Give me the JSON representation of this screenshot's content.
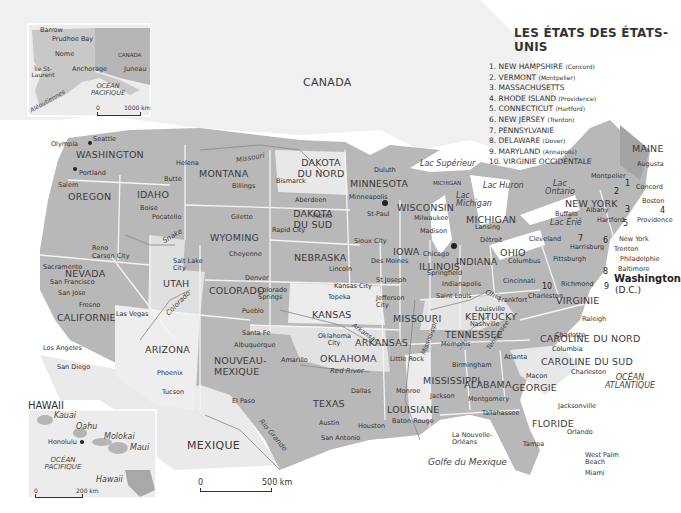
{
  "legend": {
    "title": "LES ÉTATS DES ÉTATS-UNIS",
    "items": [
      {
        "n": "1.",
        "state": "NEW HAMPSHIRE",
        "capital": "(Concord)"
      },
      {
        "n": "2.",
        "state": "VERMONT",
        "capital": "(Montpelier)"
      },
      {
        "n": "3.",
        "state": "MASSACHUSETTS",
        "capital": ""
      },
      {
        "n": "4.",
        "state": "RHODE ISLAND",
        "capital": "(Providence)"
      },
      {
        "n": "5.",
        "state": "CONNECTICUT",
        "capital": "(Hartford)"
      },
      {
        "n": "6.",
        "state": "NEW JERSEY",
        "capital": "(Trenton)"
      },
      {
        "n": "7.",
        "state": "PENNSYLVANIE",
        "capital": ""
      },
      {
        "n": "8.",
        "state": "DELAWARE",
        "capital": "(Dover)"
      },
      {
        "n": "9.",
        "state": "MARYLAND",
        "capital": "(Annapolis)"
      },
      {
        "n": "10.",
        "state": "VIRGINIE OCCIDENTALE",
        "capital": ""
      }
    ]
  },
  "countries": {
    "canada": "CANADA",
    "mexique": "MEXIQUE"
  },
  "oceans": {
    "atlantique": "OCÉAN ATLANTIQUE",
    "golfe": "Golfe du Mexique"
  },
  "alaska_inset": {
    "places": {
      "barrow": "Barrow",
      "prudhoe": "Prudhoe Bay",
      "nome": "Nome",
      "ile": "Île St-Laurent",
      "anchorage": "Anchorage",
      "juneau": "Juneau",
      "canada": "CANADA",
      "ocean": "OCÉAN PACIFIQUE",
      "aleoutiennes": "Aléoutiennes"
    },
    "scale": {
      "zero": "0",
      "max": "1000 km"
    }
  },
  "hawaii_inset": {
    "title": "HAWAII",
    "places": {
      "kauai": "Kauai",
      "oahu": "Oahu",
      "molokai": "Molokai",
      "maui": "Maui",
      "hawaii": "Hawaii",
      "honolulu": "Honolulu",
      "ocean": "OCÉAN PACIFIQUE"
    },
    "scale": {
      "zero": "0",
      "max": "200 km"
    }
  },
  "main_scale": {
    "zero": "0",
    "max": "500 km"
  },
  "states": {
    "washington": "WASHINGTON",
    "oregon": "OREGON",
    "idaho": "IDAHO",
    "montana": "MONTANA",
    "wyoming": "WYOMING",
    "dakota_nord": "DAKOTA DU NORD",
    "dakota_sud": "DAKOTA DU SUD",
    "nebraska": "NEBRASKA",
    "minnesota": "MINNESOTA",
    "wisconsin": "WISCONSIN",
    "iowa": "IOWA",
    "michigan": "MICHIGAN",
    "michigan_up": "MICHIGAN",
    "illinois": "ILLINOIS",
    "indiana": "INDIANA",
    "ohio": "OHIO",
    "newyork": "NEW YORK",
    "maine": "MAINE",
    "nevada": "NEVADA",
    "utah": "UTAH",
    "colorado": "COLORADO",
    "kansas": "KANSAS",
    "missouri": "MISSOURI",
    "kentucky": "KENTUCKY",
    "virginie": "VIRGINIE",
    "california": "CALIFORNIE",
    "arizona": "ARIZONA",
    "nouveau_mexique": "NOUVEAU-MEXIQUE",
    "oklahoma": "OKLAHOMA",
    "arkansas": "ARKANSAS",
    "tennessee": "TENNESSEE",
    "caroline_nord": "CAROLINE DU NORD",
    "caroline_sud": "CAROLINE DU SUD",
    "mississippi": "MISSISSIPPI",
    "alabama": "ALABAMA",
    "georgie": "GEORGIE",
    "texas": "TEXAS",
    "louisiane": "LOUISIANE",
    "floride": "FLORIDE",
    "washington_dc": "Washington",
    "dc": "(D.C.)"
  },
  "water": {
    "missouri": "Missouri",
    "snake": "Snake",
    "colorado": "Colorado",
    "arkansas": "Arkansas",
    "red_river": "Red River",
    "rio_grande": "Rio Grande",
    "mississippi": "Mississippi",
    "ohio": "Ohio",
    "tennessee": "Tennessee",
    "superieur": "Lac Supérieur",
    "michigan": "Lac Michigan",
    "huron": "Lac Huron",
    "ontario": "Lac Ontario",
    "erie": "Lac Érié"
  },
  "cities": {
    "seattle": "Seattle",
    "olympia": "Olympia",
    "portland": "Portland",
    "salem": "Salem",
    "helena": "Helena",
    "butte": "Butte",
    "billings": "Billings",
    "boise": "Boise",
    "pocatello": "Pocatello",
    "bismarck": "Bismarck",
    "aberdeen": "Aberdeen",
    "pierre": "Pierre",
    "rapid": "Rapid City",
    "gillette": "Gilette",
    "cheyenne": "Cheyenne",
    "duluth": "Duluth",
    "minneapolis": "Minneapolis",
    "stpaul": "St-Paul",
    "milwaukee": "Milwaukee",
    "madison": "Madison",
    "lansing": "Lansing",
    "detroit": "Détroit",
    "sioux": "Sioux City",
    "desmoines": "Des Moines",
    "lincoln": "Lincoln",
    "chicago": "Chicago",
    "springfield": "Springfield",
    "indianapolis": "Indianapolis",
    "cleveland": "Cleveland",
    "columbus": "Columbus",
    "cincinnati": "Cincinnati",
    "pittsburgh": "Pittsburgh",
    "buffalo": "Buffalo",
    "albany": "Albany",
    "montpelier": "Montpelier",
    "augusta": "Augusta",
    "concord": "Concord",
    "boston": "Boston",
    "providence": "Providence",
    "hartford": "Hartford",
    "newyork": "New York",
    "trenton": "Trenton",
    "harrisburg": "Harrisburg",
    "philadelphie": "Philadelphie",
    "baltimore": "Baltimore",
    "richmond": "Richmond",
    "charleston_wv": "Charleston",
    "frankfort": "Frankfort",
    "louisville": "Louisville",
    "nashville": "Nashville",
    "memphis": "Memphis",
    "raleigh": "Raleigh",
    "charlotte": "Charlotte",
    "columbia": "Columbia",
    "charleston": "Charleston",
    "atlanta": "Atlanta",
    "macon": "Macon",
    "birmingham": "Birmingham",
    "montgomery": "Montgomery",
    "jackson": "Jackson",
    "tallahassee": "Tallahassee",
    "jacksonville": "Jacksonville",
    "orlando": "Orlando",
    "tampa": "Tampa",
    "westpalm": "West Palm Beach",
    "miami": "Miami",
    "neworleans": "La Nouvelle-Orléans",
    "batonrouge": "Baton Rouge",
    "monroe": "Monroe",
    "littlerock": "Little Rock",
    "houston": "Houston",
    "austin": "Austin",
    "sanantonio": "San Antonio",
    "dallas": "Dallas",
    "amarillo": "Amarillo",
    "okc": "Oklahoma City",
    "kansascity": "Kansas City",
    "topeka": "Topeka",
    "stjoseph": "St Joseph",
    "jefferson": "Jefferson City",
    "stlouis": "Saint Louis",
    "denver": "Denver",
    "coloradosprings": "Colorado Springs",
    "pueblo": "Pueblo",
    "santafe": "Santa Fe",
    "albuquerque": "Albuquerque",
    "elpaso": "El Paso",
    "phoenix": "Phoenix",
    "tucson": "Tucson",
    "saltlake": "Salt Lake City",
    "reno": "Reno",
    "carson": "Carson City",
    "lasvegas": "Las Vegas",
    "sacramento": "Sacramento",
    "sanfrancisco": "San Francisco",
    "sanjose": "San Jose",
    "fresno": "Fresno",
    "losangeles": "Los Angeles",
    "sandiego": "San Diego"
  },
  "colors": {
    "land_light": "#e4e4e4",
    "land_mid": "#c4c4c4",
    "land_dark": "#a9a9a9",
    "water": "#ffffff",
    "border": "#f2f2f2"
  }
}
